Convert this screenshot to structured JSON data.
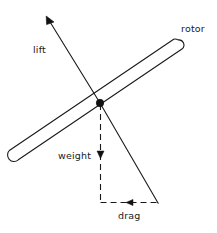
{
  "diagram": {
    "type": "free-body-force-diagram",
    "background_color": "#ffffff",
    "stroke_color": "#1a1a1a",
    "labels": {
      "lift": "lift",
      "rotor": "rotor",
      "weight": "weight",
      "drag": "drag"
    },
    "elements": {
      "hub": {
        "name": "rotor hub",
        "center_x": 100,
        "center_y": 103,
        "radius": 3.6,
        "fill": "#111111"
      },
      "rotor_blade": {
        "name": "rotor blade",
        "tip_upper_right_x": 178,
        "tip_upper_right_y": 45,
        "tip_lower_left_x": 14,
        "tip_lower_left_y": 155,
        "half_width": 5.2,
        "angle_deg": -33.9,
        "stroke_width": 1.1,
        "fill": "none"
      },
      "lift_vector": {
        "name": "lift vector",
        "from_x": 100,
        "from_y": 103,
        "to_x": 47,
        "to_y": 18,
        "arrowhead": "filled-triangle",
        "arrow_at": "tip",
        "style": "solid",
        "stroke_width": 1.1
      },
      "resultant_vector": {
        "name": "resultant force line",
        "from_x": 100,
        "from_y": 103,
        "to_x": 158,
        "to_y": 203,
        "arrowhead": "none",
        "style": "solid",
        "stroke_width": 1.1
      },
      "weight_component": {
        "name": "weight component",
        "from_x": 100.5,
        "from_y": 103,
        "to_x": 100.5,
        "to_y": 203,
        "arrowhead": "filled-triangle",
        "arrow_direction": "down",
        "arrow_x": 100.5,
        "arrow_y": 157,
        "style": "dashed",
        "dash_pattern": "6,4",
        "stroke_width": 1.1
      },
      "drag_component": {
        "name": "drag component",
        "from_x": 100.5,
        "from_y": 202.5,
        "to_x": 158,
        "to_y": 202.5,
        "arrowhead": "filled-triangle",
        "arrow_direction": "left",
        "arrow_x": 128,
        "arrow_y": 202.5,
        "style": "dashed",
        "dash_pattern": "6,4",
        "stroke_width": 1.1
      }
    }
  }
}
